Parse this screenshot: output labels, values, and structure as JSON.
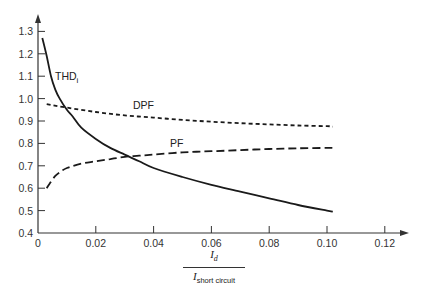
{
  "chart_data": {
    "type": "line",
    "title": "",
    "xlabel": "I_d / I_short circuit",
    "ylabel": "",
    "xlim": [
      0,
      0.125
    ],
    "ylim": [
      0.4,
      1.35
    ],
    "grid": false,
    "legend_position": "inline labels",
    "x_ticks": [
      "0",
      "0.02",
      "0.04",
      "0.06",
      "0.08",
      "0.10",
      "0.12"
    ],
    "y_ticks": [
      "0.4",
      "0.5",
      "0.6",
      "0.7",
      "0.8",
      "0.9",
      "1.0",
      "1.1",
      "1.2",
      "1.3"
    ],
    "series": [
      {
        "name": "THD_i",
        "style": "solid",
        "x": [
          0.0015,
          0.003,
          0.0045,
          0.006,
          0.0075,
          0.01,
          0.012,
          0.015,
          0.02,
          0.025,
          0.03,
          0.035,
          0.04,
          0.05,
          0.06,
          0.07,
          0.08,
          0.09,
          0.1,
          0.102
        ],
        "values": [
          1.27,
          1.19,
          1.1,
          1.04,
          1.0,
          0.95,
          0.92,
          0.87,
          0.82,
          0.78,
          0.75,
          0.72,
          0.69,
          0.65,
          0.615,
          0.585,
          0.555,
          0.525,
          0.5,
          0.495
        ]
      },
      {
        "name": "DPF",
        "style": "short-dash",
        "x": [
          0.003,
          0.01,
          0.02,
          0.03,
          0.04,
          0.05,
          0.06,
          0.07,
          0.08,
          0.09,
          0.1,
          0.102
        ],
        "values": [
          0.975,
          0.96,
          0.94,
          0.925,
          0.915,
          0.905,
          0.897,
          0.89,
          0.885,
          0.88,
          0.877,
          0.875
        ]
      },
      {
        "name": "PF",
        "style": "long-dash",
        "x": [
          0.003,
          0.004,
          0.006,
          0.008,
          0.01,
          0.015,
          0.02,
          0.025,
          0.03,
          0.035,
          0.04,
          0.05,
          0.06,
          0.07,
          0.08,
          0.09,
          0.1,
          0.102
        ],
        "values": [
          0.6,
          0.62,
          0.655,
          0.675,
          0.69,
          0.71,
          0.72,
          0.73,
          0.74,
          0.745,
          0.75,
          0.76,
          0.765,
          0.77,
          0.775,
          0.778,
          0.78,
          0.78
        ]
      }
    ],
    "annotations": [
      {
        "text": "THD_i",
        "x": 0.007,
        "y": 1.15
      },
      {
        "text": "DPF",
        "x": 0.037,
        "y": 0.975
      },
      {
        "text": "PF",
        "x": 0.048,
        "y": 0.79
      }
    ]
  },
  "labels": {
    "thd": "THD",
    "thd_sub": "i",
    "dpf": "DPF",
    "pf": "PF",
    "x_num": "I",
    "x_num_sub": "d",
    "x_den": "I",
    "x_den_sub": "short circuit"
  },
  "colors": {
    "line": "#1a1a1a",
    "axis": "#333333",
    "background": "#ffffff"
  }
}
